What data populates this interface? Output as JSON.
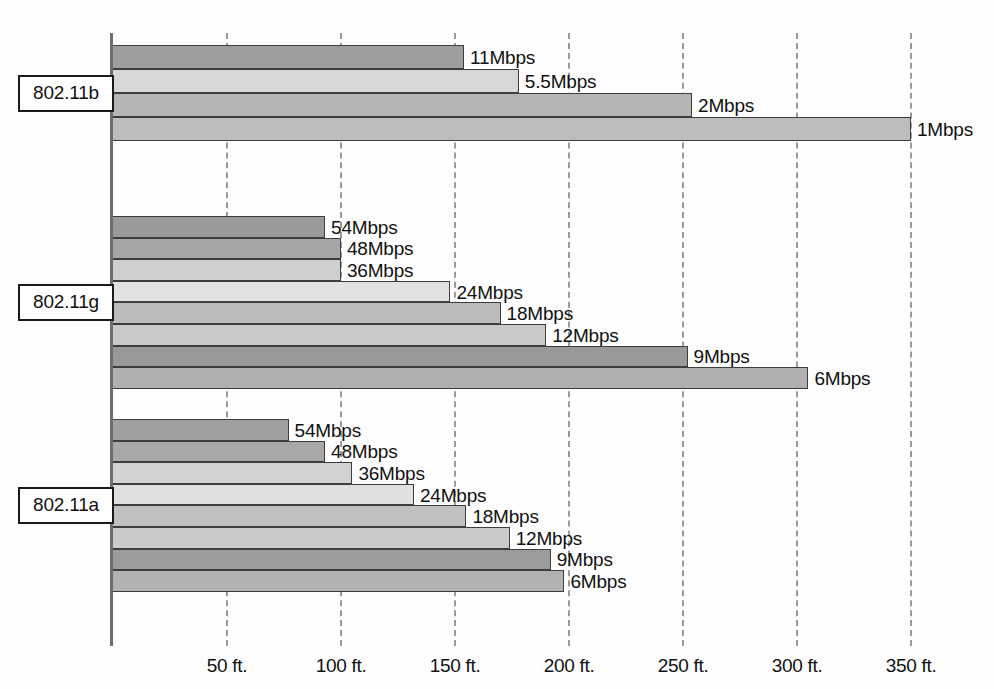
{
  "chart_data": {
    "type": "bar",
    "orientation": "horizontal",
    "title": "",
    "xlabel": "",
    "ylabel": "",
    "xlim": [
      0,
      350
    ],
    "x_tick_labels": [
      "50 ft.",
      "100 ft.",
      "150 ft.",
      "200 ft.",
      "250 ft.",
      "300 ft.",
      "350 ft."
    ],
    "x_tick_values": [
      50,
      100,
      150,
      200,
      250,
      300,
      350
    ],
    "x_unit": "ft",
    "grid": "vertical-dashed",
    "legend": "none",
    "groups": [
      {
        "name": "802.11b",
        "bars": [
          {
            "label": "11Mbps",
            "value": 154,
            "shade": "#9e9e9e"
          },
          {
            "label": "5.5Mbps",
            "value": 178,
            "shade": "#d7d7d7"
          },
          {
            "label": "2Mbps",
            "value": 254,
            "shade": "#b4b4b4"
          },
          {
            "label": "1Mbps",
            "value": 350,
            "shade": "#bdbdbd"
          }
        ]
      },
      {
        "name": "802.11g",
        "bars": [
          {
            "label": "54Mbps",
            "value": 93,
            "shade": "#9a9a9a"
          },
          {
            "label": "48Mbps",
            "value": 100,
            "shade": "#a5a5a5"
          },
          {
            "label": "36Mbps",
            "value": 100,
            "shade": "#cfcfcf"
          },
          {
            "label": "24Mbps",
            "value": 148,
            "shade": "#e2e2e2"
          },
          {
            "label": "18Mbps",
            "value": 170,
            "shade": "#bcbcbc"
          },
          {
            "label": "12Mbps",
            "value": 190,
            "shade": "#c9c9c9"
          },
          {
            "label": "9Mbps",
            "value": 252,
            "shade": "#999999"
          },
          {
            "label": "6Mbps",
            "value": 305,
            "shade": "#b0b0b0"
          }
        ]
      },
      {
        "name": "802.11a",
        "bars": [
          {
            "label": "54Mbps",
            "value": 77,
            "shade": "#a0a0a0"
          },
          {
            "label": "48Mbps",
            "value": 93,
            "shade": "#a8a8a8"
          },
          {
            "label": "36Mbps",
            "value": 105,
            "shade": "#d2d2d2"
          },
          {
            "label": "24Mbps",
            "value": 132,
            "shade": "#e0e0e0"
          },
          {
            "label": "18Mbps",
            "value": 155,
            "shade": "#c0c0c0"
          },
          {
            "label": "12Mbps",
            "value": 174,
            "shade": "#cacaca"
          },
          {
            "label": "9Mbps",
            "value": 192,
            "shade": "#9b9b9b"
          },
          {
            "label": "6Mbps",
            "value": 198,
            "shade": "#b2b2b2"
          }
        ]
      }
    ],
    "colors": {
      "axis": "#6e6e6e",
      "gridline": "#9a9a9a",
      "bar_outline": "#3d3d3d",
      "text": "#111111",
      "background": "#fefefe"
    }
  }
}
